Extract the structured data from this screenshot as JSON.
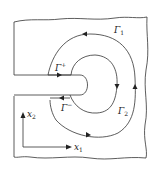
{
  "diagram": {
    "type": "cracked body with J-integral contours",
    "contours": [
      {
        "id": "gamma1",
        "label": "Γ",
        "subscript": "1",
        "direction": "counterclockwise"
      },
      {
        "id": "gamma2",
        "label": "Γ",
        "subscript": "2",
        "direction": "clockwise"
      },
      {
        "id": "gamma_plus",
        "label": "Γ",
        "superscript": "+"
      },
      {
        "id": "gamma_minus",
        "label": "Γ",
        "superscript": "−"
      }
    ],
    "axes": {
      "x1": {
        "label": "x",
        "subscript": "1"
      },
      "x2": {
        "label": "x",
        "subscript": "2"
      }
    },
    "colors": {
      "stroke": "#222222",
      "background": "#ffffff"
    }
  }
}
